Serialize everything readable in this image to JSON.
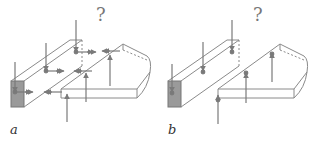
{
  "panels": [
    {
      "label": "a",
      "question": "?"
    },
    {
      "label": "b",
      "question": "?"
    }
  ],
  "colors": {
    "line": "#8a8a8a",
    "arrow": "#7a7a7a",
    "shade": "#9a9a9a",
    "text": "#333333"
  }
}
